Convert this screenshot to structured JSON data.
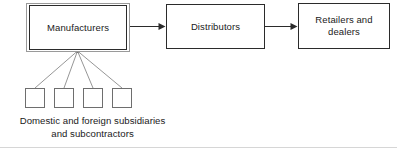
{
  "diagram": {
    "type": "flow-diagram",
    "canvas": {
      "width": 397,
      "height": 150,
      "background": "#ffffff"
    },
    "colors": {
      "box_border": "#2b2b2b",
      "box_outer_border": "#9a9a9a",
      "sub_box_border": "#6e6e6e",
      "connector": "#2b2b2b",
      "fan_connector": "#8a8a8a",
      "text": "#1a1a1a",
      "background": "#ffffff"
    },
    "nodes": [
      {
        "id": "manufacturers",
        "label": "Manufacturers",
        "emphasis": "double-border"
      },
      {
        "id": "distributors",
        "label": "Distributors",
        "emphasis": "single-border"
      },
      {
        "id": "retailers",
        "label": "Retailers and\ndealers",
        "emphasis": "single-border"
      }
    ],
    "sub_nodes": [
      {
        "id": "sub-0",
        "label": ""
      },
      {
        "id": "sub-1",
        "label": ""
      },
      {
        "id": "sub-2",
        "label": ""
      },
      {
        "id": "sub-3",
        "label": ""
      }
    ],
    "caption": "Domestic and foreign subsidiaries\nand subcontractors",
    "connectors": [
      {
        "from": "manufacturers",
        "to": "distributors",
        "style": "arrow"
      },
      {
        "from": "distributors",
        "to": "retailers",
        "style": "arrow"
      },
      {
        "from": "manufacturers",
        "to": "sub-0",
        "style": "line"
      },
      {
        "from": "manufacturers",
        "to": "sub-1",
        "style": "line"
      },
      {
        "from": "manufacturers",
        "to": "sub-2",
        "style": "line"
      },
      {
        "from": "manufacturers",
        "to": "sub-3",
        "style": "line"
      }
    ]
  }
}
